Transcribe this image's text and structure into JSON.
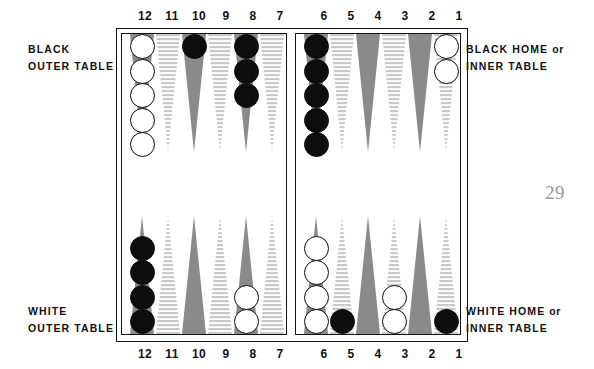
{
  "page": {
    "number": "29"
  },
  "numbers": {
    "top": [
      "12",
      "11",
      "10",
      "9",
      "8",
      "7",
      "6",
      "5",
      "4",
      "3",
      "2",
      "1"
    ],
    "bottom": [
      "12",
      "11",
      "10",
      "9",
      "8",
      "7",
      "6",
      "5",
      "4",
      "3",
      "2",
      "1"
    ]
  },
  "labels": {
    "black_outer_line1": "BLACK",
    "black_outer_line2": "OUTER TABLE",
    "black_home_line1a": "BLACK HOME",
    "black_home_line1b": "or",
    "black_home_line2": "INNER TABLE",
    "white_outer_line1": "WHITE",
    "white_outer_line2": "OUTER TABLE",
    "white_home_line1a": "WHITE HOME",
    "white_home_line1b": "or",
    "white_home_line2": "INNER TABLE"
  },
  "colors": {
    "checker_black": "#0d0d0d",
    "checker_white": "#ffffff",
    "point_dark": "#8a8a8a",
    "point_light": "#c9c9c9",
    "frame": "#111111",
    "page_number": "#9a9a9a"
  },
  "board": {
    "points_per_quadrant": 6,
    "quadrants": {
      "top_left": {
        "labels": [
          "12",
          "11",
          "10",
          "9",
          "8",
          "7"
        ]
      },
      "top_right": {
        "labels": [
          "6",
          "5",
          "4",
          "3",
          "2",
          "1"
        ]
      },
      "bottom_left": {
        "labels": [
          "12",
          "11",
          "10",
          "9",
          "8",
          "7"
        ]
      },
      "bottom_right": {
        "labels": [
          "6",
          "5",
          "4",
          "3",
          "2",
          "1"
        ]
      }
    },
    "checkers": [
      {
        "quadrant": "top_left",
        "point": "12",
        "color": "white",
        "count": 5
      },
      {
        "quadrant": "top_left",
        "point": "11",
        "color": "none",
        "count": 0
      },
      {
        "quadrant": "top_left",
        "point": "10",
        "color": "black",
        "count": 1
      },
      {
        "quadrant": "top_left",
        "point": "9",
        "color": "none",
        "count": 0
      },
      {
        "quadrant": "top_left",
        "point": "8",
        "color": "black",
        "count": 3
      },
      {
        "quadrant": "top_left",
        "point": "7",
        "color": "none",
        "count": 0
      },
      {
        "quadrant": "top_right",
        "point": "6",
        "color": "black",
        "count": 5
      },
      {
        "quadrant": "top_right",
        "point": "5",
        "color": "none",
        "count": 0
      },
      {
        "quadrant": "top_right",
        "point": "4",
        "color": "none",
        "count": 0
      },
      {
        "quadrant": "top_right",
        "point": "3",
        "color": "none",
        "count": 0
      },
      {
        "quadrant": "top_right",
        "point": "2",
        "color": "none",
        "count": 0
      },
      {
        "quadrant": "top_right",
        "point": "1",
        "color": "white",
        "count": 2
      },
      {
        "quadrant": "bottom_left",
        "point": "12",
        "color": "black",
        "count": 4
      },
      {
        "quadrant": "bottom_left",
        "point": "11",
        "color": "none",
        "count": 0
      },
      {
        "quadrant": "bottom_left",
        "point": "10",
        "color": "none",
        "count": 0
      },
      {
        "quadrant": "bottom_left",
        "point": "9",
        "color": "none",
        "count": 0
      },
      {
        "quadrant": "bottom_left",
        "point": "8",
        "color": "white",
        "count": 2
      },
      {
        "quadrant": "bottom_left",
        "point": "7",
        "color": "none",
        "count": 0
      },
      {
        "quadrant": "bottom_right",
        "point": "6",
        "color": "white",
        "count": 4
      },
      {
        "quadrant": "bottom_right",
        "point": "5",
        "color": "black",
        "count": 1
      },
      {
        "quadrant": "bottom_right",
        "point": "4",
        "color": "none",
        "count": 0
      },
      {
        "quadrant": "bottom_right",
        "point": "3",
        "color": "white",
        "count": 2
      },
      {
        "quadrant": "bottom_right",
        "point": "2",
        "color": "none",
        "count": 0
      },
      {
        "quadrant": "bottom_right",
        "point": "1",
        "color": "black",
        "count": 1
      }
    ]
  }
}
